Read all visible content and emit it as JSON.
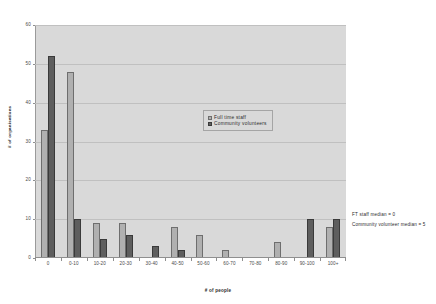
{
  "chart_data": {
    "type": "bar",
    "title": "",
    "xlabel": "# of people",
    "ylabel": "# of organisations",
    "ylim": [
      0,
      60
    ],
    "yticks": [
      0,
      10,
      20,
      30,
      40,
      50,
      60
    ],
    "grid": true,
    "legend_position": "center",
    "categories": [
      "0",
      "0-10",
      "10-20",
      "20-30",
      "30-40",
      "40-50",
      "50-60",
      "60-70",
      "70-80",
      "80-90",
      "90-100",
      "100+"
    ],
    "series": [
      {
        "name": "Full time staff",
        "color": "#b0b0b0",
        "values": [
          33,
          48,
          9,
          9,
          0,
          8,
          6,
          2,
          0,
          4,
          0,
          8
        ]
      },
      {
        "name": "Community volunteers",
        "color": "#5e5e5e",
        "values": [
          52,
          10,
          5,
          6,
          3,
          2,
          0,
          0,
          0,
          0,
          10,
          10
        ]
      }
    ],
    "annotations": [
      "FT staff median = 0",
      "Community volunteer median = 5"
    ]
  }
}
